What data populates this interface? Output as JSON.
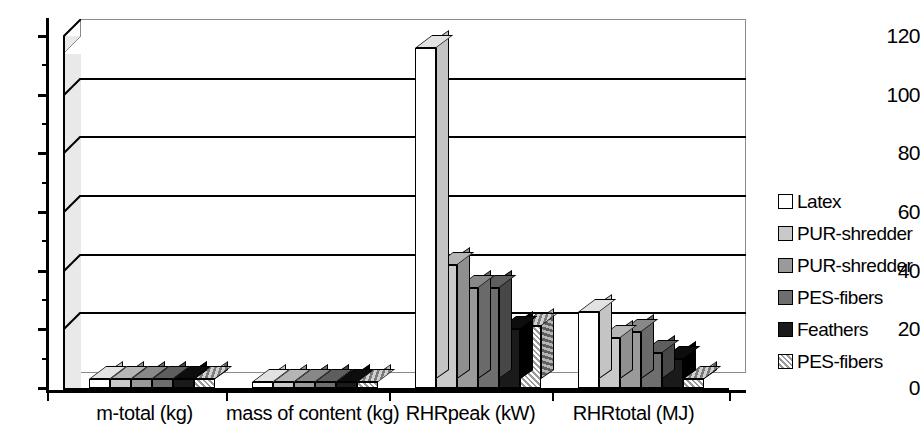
{
  "chart_data": {
    "type": "bar",
    "title": "",
    "xlabel": "",
    "ylabel": "",
    "ylim": [
      0,
      120
    ],
    "yticks": [
      0,
      20,
      40,
      60,
      80,
      100,
      120
    ],
    "grid": true,
    "legend_position": "right",
    "style": "3d-clustered-column",
    "categories": [
      "m-total (kg)",
      "mass of content (kg)",
      "RHRpeak (kW)",
      "RHRtotal (MJ)"
    ],
    "series": [
      {
        "name": "Latex",
        "swatch": "#ffffff",
        "values": [
          3.0,
          2.0,
          116.0,
          26.0
        ]
      },
      {
        "name": "PUR-shredder",
        "swatch": "#c9c9c9",
        "values": [
          3.0,
          2.0,
          42.0,
          17.0
        ]
      },
      {
        "name": "PUR-shredder",
        "swatch": "#9a9a9a",
        "values": [
          3.0,
          2.0,
          34.0,
          19.0
        ]
      },
      {
        "name": "PES-fibers",
        "swatch": "#6e6e6e",
        "values": [
          3.0,
          2.0,
          34.0,
          12.0
        ]
      },
      {
        "name": "Feathers",
        "swatch": "#1a1a1a",
        "values": [
          3.0,
          2.0,
          20.0,
          10.0
        ]
      },
      {
        "name": "PES-fibers",
        "swatch": "hatched",
        "values": [
          3.0,
          2.0,
          21.0,
          3.0
        ]
      }
    ]
  },
  "axis": {
    "y_tick_labels": [
      "120",
      "100",
      "80",
      "60",
      "40",
      "20",
      "0"
    ]
  },
  "legend": {
    "items": [
      {
        "label": "Latex"
      },
      {
        "label": "PUR-shredder"
      },
      {
        "label": "PUR-shredder"
      },
      {
        "label": "PES-fibers"
      },
      {
        "label": "Feathers"
      },
      {
        "label": "PES-fibers"
      }
    ]
  }
}
